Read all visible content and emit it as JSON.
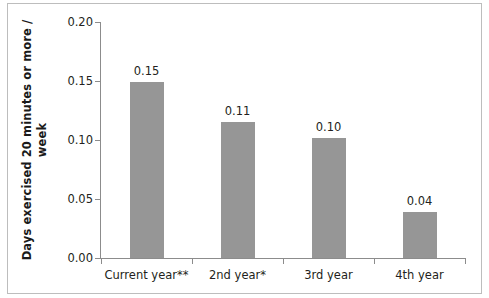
{
  "chart_data": {
    "type": "bar",
    "title": "",
    "xlabel": "",
    "ylabel": "Days exercised  20 minutes or more /",
    "ylabel_line2": "week",
    "categories": [
      "Current year**",
      "2nd year*",
      "3rd year",
      "4th year"
    ],
    "values": [
      0.149,
      0.1155,
      0.1015,
      0.039
    ],
    "data_labels": [
      "0.15",
      "0.11",
      "0.10",
      "0.04"
    ],
    "ylim": [
      0.0,
      0.2
    ],
    "ytick_values": [
      0.0,
      0.05,
      0.1,
      0.15,
      0.2
    ],
    "ytick_labels": [
      "0.00",
      "0.05",
      "0.10",
      "0.15",
      "0.20"
    ],
    "grid": false,
    "legend": false,
    "bar_color": "#969696",
    "axis_color": "#8c8c8c",
    "text_color": "#231f20",
    "frame_color": "#bdbdbd",
    "background": "#ffffff"
  }
}
